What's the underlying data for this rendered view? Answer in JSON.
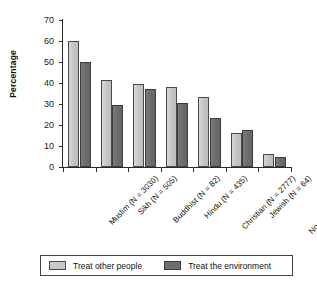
{
  "chart_data": {
    "type": "bar",
    "title": "",
    "xlabel": "",
    "ylabel": "Percentage",
    "ylim": [
      0,
      70
    ],
    "yticks": [
      0,
      10,
      20,
      30,
      40,
      50,
      60,
      70
    ],
    "grid": false,
    "legend_position": "bottom",
    "categories": [
      "Muslim (N = 3030)",
      "Sikh (N = 505)",
      "Buddhist (N = 82)",
      "Hindu (N = 435)",
      "Christian (N = 2777)",
      "Jewish (N = 64)",
      "No religion (N = 1752)"
    ],
    "series": [
      {
        "name": "Treat other people",
        "color": "#c9c9c9",
        "values": [
          60.0,
          41.5,
          39.5,
          38.0,
          33.5,
          16.0,
          6.0
        ]
      },
      {
        "name": "Treat the environment",
        "color": "#6e6e6e",
        "values": [
          50.0,
          29.5,
          37.0,
          30.5,
          23.5,
          17.5,
          5.0
        ]
      }
    ]
  },
  "legend": {
    "items": [
      {
        "label": "Treat other people"
      },
      {
        "label": "Treat the environment"
      }
    ]
  }
}
